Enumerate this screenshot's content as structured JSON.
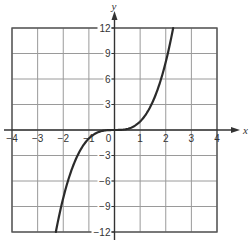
{
  "chart_data": {
    "type": "line",
    "title": "",
    "function": "y = x^3",
    "xlabel": "x",
    "ylabel": "y",
    "xlim": [
      -4,
      4
    ],
    "ylim": [
      -12,
      12
    ],
    "grid": true,
    "legend": null,
    "x_ticks": [
      -4,
      -3,
      -2,
      -1,
      0,
      1,
      2,
      3,
      4
    ],
    "x_tick_labels": [
      "−4",
      "−3",
      "−2",
      "−1",
      "0",
      "1",
      "2",
      "3",
      "4"
    ],
    "y_ticks": [
      -12,
      -9,
      -6,
      -3,
      3,
      6,
      9,
      12
    ],
    "y_tick_labels": [
      "−12",
      "−9",
      "−6",
      "−3",
      "3",
      "6",
      "9",
      "12"
    ],
    "series": [
      {
        "name": "y = x^3",
        "x": [
          -2.29,
          -2,
          -1.5,
          -1,
          -0.5,
          0,
          0.5,
          1,
          1.5,
          2,
          2.29
        ],
        "y": [
          -12,
          -8,
          -3.375,
          -1,
          -0.125,
          0,
          0.125,
          1,
          3.375,
          8,
          12
        ]
      }
    ],
    "colors": {
      "grid": "#9a9a9a",
      "frame": "#555555",
      "axis": "#333333",
      "curve": "#2b2b2b"
    }
  }
}
